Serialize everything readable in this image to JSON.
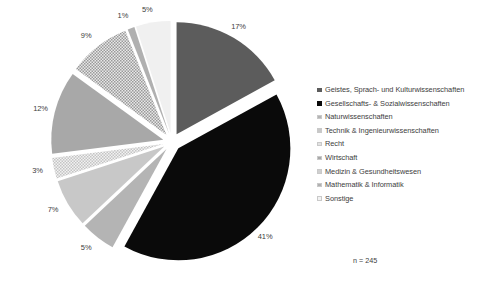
{
  "chart_data": {
    "type": "pie",
    "title": "",
    "subtitle": "",
    "xlabel": "",
    "ylabel": "",
    "legend_position": "right",
    "grid": false,
    "exploded": true,
    "start_angle_deg": 0,
    "direction": "clockwise",
    "sample_note": "n = 245",
    "sample_size": 245,
    "categories": [
      "Geistes, Sprach- und Kulturwissenschaften",
      "Gesellschafts- & Sozialwissenschaften",
      "Naturwissenschaften",
      "Technik & Ingenieurwissenschaften",
      "Recht",
      "Wirtschaft",
      "Medizin & Gesundheitswesen",
      "Mathematik & Informatik",
      "Sonstige"
    ],
    "values": [
      17,
      41,
      5,
      7,
      3,
      12,
      9,
      1,
      5
    ],
    "value_labels": [
      "17%",
      "41%",
      "5%",
      "7%",
      "3%",
      "12%",
      "9%",
      "1%",
      "5%"
    ],
    "slices": [
      {
        "label": "Geistes, Sprach- und Kulturwissenschaften",
        "value": 17,
        "value_label": "17%",
        "color": "#5c5c5c",
        "fill": "solid"
      },
      {
        "label": "Gesellschafts- & Sozialwissenschaften",
        "value": 41,
        "value_label": "41%",
        "color": "#0a0a0a",
        "fill": "solid"
      },
      {
        "label": "Naturwissenschaften",
        "value": 5,
        "value_label": "5%",
        "color": "#b4b4b4",
        "fill": "solid"
      },
      {
        "label": "Technik & Ingenieurwissenschaften",
        "value": 7,
        "value_label": "7%",
        "color": "#c8c8c8",
        "fill": "solid"
      },
      {
        "label": "Recht",
        "value": 3,
        "value_label": "3%",
        "color": "#dcdcdc",
        "fill": "checker-light"
      },
      {
        "label": "Wirtschaft",
        "value": 12,
        "value_label": "12%",
        "color": "#a8a8a8",
        "fill": "solid"
      },
      {
        "label": "Medizin & Gesundheitswesen",
        "value": 9,
        "value_label": "9%",
        "color": "#cfcfcf",
        "fill": "checker"
      },
      {
        "label": "Mathematik & Informatik",
        "value": 1,
        "value_label": "1%",
        "color": "#b0b0b0",
        "fill": "solid"
      },
      {
        "label": "Sonstige",
        "value": 5,
        "value_label": "5%",
        "color": "#f0f0f0",
        "fill": "solid"
      }
    ],
    "ylim": [
      0,
      100
    ]
  },
  "legend": {
    "items": [
      {
        "label": "Geistes, Sprach- und Kulturwissenschaften",
        "color": "#5c5c5c"
      },
      {
        "label": "Gesellschafts- & Sozialwissenschaften",
        "color": "#0a0a0a"
      },
      {
        "label": "Naturwissenschaften",
        "color": "#b4b4b4"
      },
      {
        "label": "Technik & Ingenieurwissenschaften",
        "color": "#c8c8c8"
      },
      {
        "label": "Recht",
        "color": "#e2e2e2"
      },
      {
        "label": "Wirtschaft",
        "color": "#a8a8a8"
      },
      {
        "label": "Medizin & Gesundheitswesen",
        "color": "#cfcfcf"
      },
      {
        "label": "Mathematik & Informatik",
        "color": "#b0b0b0"
      },
      {
        "label": "Sonstige",
        "color": "#f2f2f2"
      }
    ]
  },
  "annotation": {
    "sample_note": "n = 245"
  }
}
